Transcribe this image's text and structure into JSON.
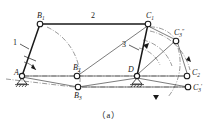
{
  "figure": {
    "caption": "（a）"
  },
  "joints": [
    {
      "id": "A",
      "label": "A",
      "sub": "",
      "prime": "",
      "x": 22,
      "y": 76,
      "type": "ground-pivot",
      "label_dx": -8,
      "label_dy": -1
    },
    {
      "id": "D",
      "label": "D",
      "sub": "",
      "prime": "",
      "x": 137,
      "y": 76,
      "type": "ground-pivot",
      "label_dx": -9,
      "label_dy": -4
    },
    {
      "id": "B1",
      "label": "B",
      "sub": "1",
      "prime": "",
      "x": 40,
      "y": 24,
      "type": "pin",
      "label_dx": -3,
      "label_dy": -6
    },
    {
      "id": "B2",
      "label": "B",
      "sub": "2",
      "prime": "",
      "x": 77,
      "y": 76,
      "type": "pin",
      "label_dx": -4,
      "label_dy": -6
    },
    {
      "id": "B3",
      "label": "B",
      "sub": "3",
      "prime": "",
      "x": 78,
      "y": 87,
      "type": "pin",
      "label_dx": -4,
      "label_dy": 11
    },
    {
      "id": "C1",
      "label": "C",
      "sub": "1",
      "prime": "",
      "x": 148,
      "y": 24,
      "type": "pin",
      "label_dx": -2,
      "label_dy": -6
    },
    {
      "id": "C3s",
      "label": "C",
      "sub": "3",
      "prime": "″",
      "x": 176,
      "y": 41,
      "type": "pin",
      "label_dx": -1,
      "label_dy": -6
    },
    {
      "id": "C2",
      "label": "C",
      "sub": "2",
      "prime": "",
      "x": 187,
      "y": 76,
      "type": "pin",
      "label_dx": 5,
      "label_dy": -1
    },
    {
      "id": "C3p",
      "label": "C",
      "sub": "3",
      "prime": "′",
      "x": 188,
      "y": 87,
      "type": "pin",
      "label_dx": 5,
      "label_dy": 3
    }
  ],
  "link_labels": [
    {
      "id": "link1",
      "text": "1",
      "x": 16,
      "y": 42
    },
    {
      "id": "link2",
      "text": "2",
      "x": 93,
      "y": 16
    },
    {
      "id": "link3",
      "text": "3",
      "x": 125,
      "y": 44
    }
  ],
  "colors": {
    "line": "#1a1a1a",
    "construction": "#555555",
    "joint_fill": "#ffffff",
    "background": "#ffffff"
  },
  "line_styles": {
    "link": "solid-thick",
    "construction": "dash-dot",
    "connector": "thin-solid"
  },
  "annotations": {
    "arc_B": "arc swept by crank AB from B1 to B3",
    "arc_C": "arcs swept by rocker DC through C1, C3-double-prime, C2, C3-prime",
    "rotation_arrow_A": "counter-clockwise rotation indicator at crank A",
    "rotation_arrow_D": "rotation indicator at rocker D"
  }
}
